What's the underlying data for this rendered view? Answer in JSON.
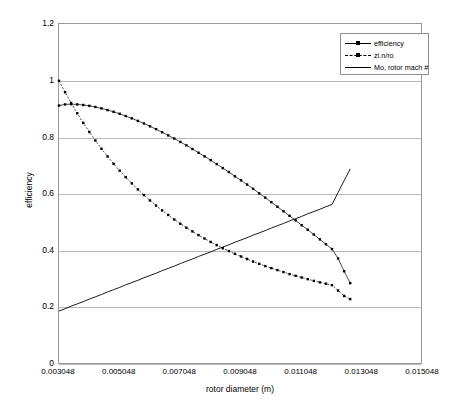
{
  "chart_data": {
    "type": "line",
    "title": "",
    "xlabel": "rotor diameter (m)",
    "ylabel": "efficiency",
    "xlim": [
      0.003048,
      0.015048
    ],
    "ylim": [
      0,
      1.2
    ],
    "grid": true,
    "legend_position": "top-right",
    "xticks": [
      "0.003048",
      "0.005048",
      "0.007048",
      "0.009048",
      "0.011048",
      "0.013048",
      "0.015048"
    ],
    "yticks": [
      "0",
      "0.2",
      "0.4",
      "0.6",
      "0.8",
      "1",
      "1.2"
    ],
    "x": [
      0.003048,
      0.003248,
      0.003448,
      0.003648,
      0.003848,
      0.004048,
      0.004248,
      0.004448,
      0.004648,
      0.004848,
      0.005048,
      0.005248,
      0.005448,
      0.005648,
      0.005848,
      0.006048,
      0.006248,
      0.006448,
      0.006648,
      0.006848,
      0.007048,
      0.007248,
      0.007448,
      0.007648,
      0.007848,
      0.008048,
      0.008248,
      0.008448,
      0.008648,
      0.008848,
      0.009048,
      0.009248,
      0.009448,
      0.009648,
      0.009848,
      0.010048,
      0.010248,
      0.010448,
      0.010648,
      0.010848,
      0.011048,
      0.011248,
      0.011448,
      0.011648,
      0.011848,
      0.012048,
      0.012248,
      0.012448,
      0.012648
    ],
    "series": [
      {
        "name": "efficiency",
        "style": "solid-marker",
        "values": [
          0.913,
          0.917,
          0.918,
          0.917,
          0.915,
          0.912,
          0.908,
          0.903,
          0.897,
          0.891,
          0.884,
          0.876,
          0.868,
          0.859,
          0.85,
          0.84,
          0.83,
          0.819,
          0.808,
          0.797,
          0.785,
          0.773,
          0.76,
          0.747,
          0.734,
          0.721,
          0.707,
          0.693,
          0.679,
          0.664,
          0.65,
          0.635,
          0.62,
          0.604,
          0.589,
          0.573,
          0.557,
          0.541,
          0.525,
          0.509,
          0.492,
          0.476,
          0.459,
          0.442,
          0.425,
          0.408,
          0.375,
          0.33,
          0.288
        ]
      },
      {
        "name": "zi.n/ro",
        "style": "dashed-marker",
        "values": [
          1.0,
          0.96,
          0.922,
          0.886,
          0.852,
          0.82,
          0.79,
          0.761,
          0.734,
          0.708,
          0.684,
          0.661,
          0.639,
          0.618,
          0.598,
          0.579,
          0.561,
          0.544,
          0.528,
          0.512,
          0.497,
          0.483,
          0.47,
          0.457,
          0.445,
          0.433,
          0.422,
          0.411,
          0.401,
          0.391,
          0.382,
          0.373,
          0.364,
          0.356,
          0.348,
          0.341,
          0.334,
          0.327,
          0.32,
          0.314,
          0.308,
          0.302,
          0.296,
          0.291,
          0.286,
          0.281,
          0.262,
          0.243,
          0.232
        ]
      },
      {
        "name": "Mo, rotor mach #",
        "style": "solid-plain",
        "values": [
          0.19,
          0.198,
          0.207,
          0.215,
          0.223,
          0.232,
          0.24,
          0.248,
          0.257,
          0.265,
          0.273,
          0.282,
          0.29,
          0.298,
          0.307,
          0.315,
          0.323,
          0.332,
          0.34,
          0.348,
          0.357,
          0.365,
          0.373,
          0.382,
          0.39,
          0.398,
          0.407,
          0.415,
          0.423,
          0.432,
          0.44,
          0.448,
          0.457,
          0.465,
          0.473,
          0.482,
          0.49,
          0.498,
          0.507,
          0.515,
          0.523,
          0.532,
          0.54,
          0.548,
          0.557,
          0.565,
          0.607,
          0.649,
          0.69
        ]
      }
    ]
  },
  "legend": {
    "entries": [
      {
        "label": "efficiency"
      },
      {
        "label": "zi.n/ro"
      },
      {
        "label": "Mo, rotor mach #"
      }
    ]
  }
}
